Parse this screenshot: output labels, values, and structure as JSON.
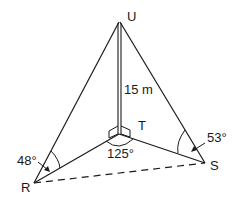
{
  "diagram": {
    "points": {
      "U": "U",
      "T": "T",
      "R": "R",
      "S": "S"
    },
    "labels": {
      "height": "15 m",
      "angle_RTS": "125°",
      "angle_URT": "48°",
      "angle_UST": "53°"
    },
    "colors": {
      "stroke": "#1a1a1a",
      "background": "#ffffff"
    }
  }
}
